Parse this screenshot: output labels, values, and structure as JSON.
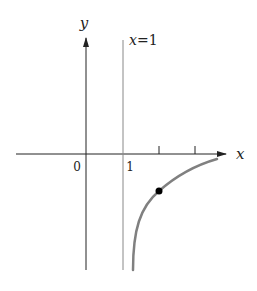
{
  "diagram": {
    "type": "function-graph",
    "axes": {
      "x_label": "x",
      "y_label": "y",
      "origin_label": "0",
      "tick_label_1": "1"
    },
    "asymptote": {
      "label": "x=1",
      "label_var": "x",
      "label_eq": "=1"
    },
    "colors": {
      "axis": "#222222",
      "asymptote": "#888888",
      "curve": "#808080",
      "point": "#000000"
    }
  }
}
